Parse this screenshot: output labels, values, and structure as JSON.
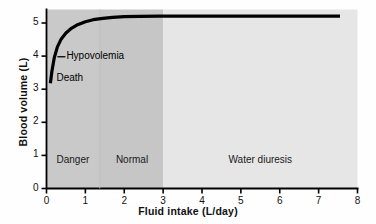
{
  "chart_data": {
    "type": "line",
    "title": "",
    "xlabel": "Fluid intake (L/day)",
    "ylabel": "Blood volume (L)",
    "xlim": [
      0,
      8
    ],
    "ylim": [
      0,
      5.6
    ],
    "xticks": [
      "0",
      "1",
      "2",
      "3",
      "4",
      "5",
      "6",
      "7",
      "8"
    ],
    "yticks": [
      "0",
      "1",
      "2",
      "3",
      "4",
      "5"
    ],
    "xtick_values": [
      0,
      1,
      2,
      3,
      4,
      5,
      6,
      7,
      8
    ],
    "ytick_values": [
      0,
      1,
      2,
      3,
      4,
      5
    ],
    "grid": false,
    "legend": "none",
    "series": [
      {
        "name": "Blood volume vs fluid intake",
        "color": "#000000",
        "x": [
          0.1,
          0.14,
          0.2,
          0.28,
          0.38,
          0.5,
          0.64,
          0.8,
          1.0,
          1.2,
          1.45,
          1.7,
          2.0,
          2.4,
          2.9,
          3.5,
          4.3,
          5.2,
          6.2,
          7.55
        ],
        "y": [
          3.18,
          3.55,
          3.95,
          4.28,
          4.52,
          4.7,
          4.84,
          4.95,
          5.04,
          5.1,
          5.14,
          5.17,
          5.19,
          5.2,
          5.21,
          5.21,
          5.21,
          5.21,
          5.21,
          5.21
        ]
      }
    ],
    "annotations": [
      {
        "name": "hypovolemia",
        "text": "Hypovolemia",
        "x": 0.28,
        "y": 3.98,
        "leader": true
      },
      {
        "name": "death",
        "text": "Death",
        "x": 0.18,
        "y": 3.32,
        "leader": false
      }
    ],
    "regions": [
      {
        "name": "danger",
        "label": "Danger",
        "x_start": 0,
        "x_end": 1.37,
        "color": "#c9c9c9",
        "label_x": 0.68,
        "label_y": 0.82
      },
      {
        "name": "normal",
        "label": "Normal",
        "x_start": 1.37,
        "x_end": 3.0,
        "color": "#c6c6c6",
        "label_x": 2.2,
        "label_y": 0.82
      },
      {
        "name": "water-diuresis",
        "label": "Water diuresis",
        "x_start": 3.0,
        "x_end": 8.0,
        "color": "#e6e6e6",
        "label_x": 5.5,
        "label_y": 0.82
      }
    ]
  }
}
